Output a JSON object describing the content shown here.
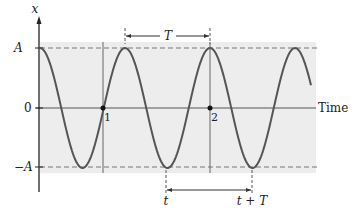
{
  "diagram": {
    "y_axis_label": "x",
    "x_axis_label": "Time",
    "amplitude_label_pos": "A",
    "zero_label": "0",
    "amplitude_label_neg": "−A",
    "point_labels": [
      "1",
      "2"
    ],
    "period_label_top": "T",
    "time_label_start": "t",
    "time_label_end": "t + T"
  },
  "colors": {
    "shade": "#ededed",
    "curve": "#555555",
    "axis": "#333333",
    "dashed": "#777777"
  },
  "curve": {
    "type": "cosine",
    "amplitude_px": 60,
    "period_px": 85,
    "x_start_px": 40,
    "x_end_px": 311,
    "zero_y_px": 108
  }
}
